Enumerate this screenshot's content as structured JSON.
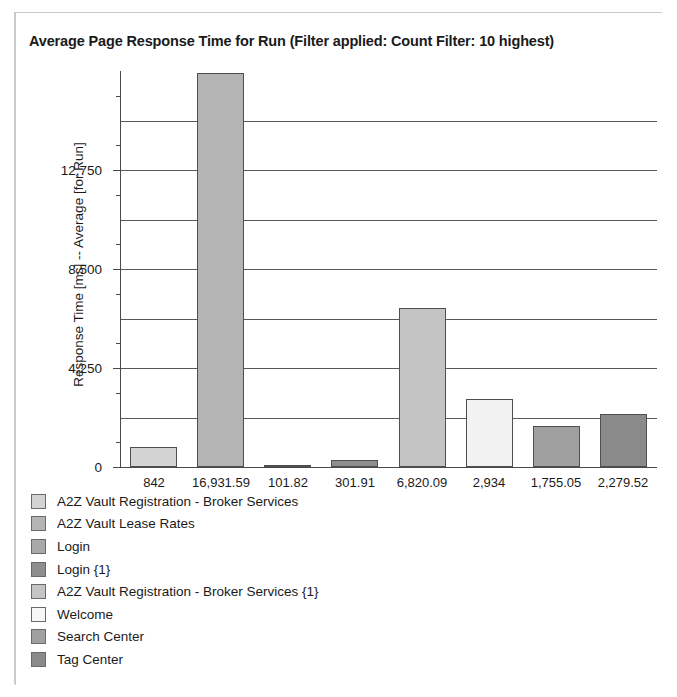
{
  "chart_title": "Average Page Response Time for Run (Filter applied: Count Filter: 10 highest)",
  "chart_data": {
    "type": "bar",
    "title": "Average Page Response Time for Run (Filter applied: Count Filter: 10 highest)",
    "xlabel": "",
    "ylabel": "Response Time [ms] -- Average [for Run]",
    "ylim": [
      0,
      17000
    ],
    "grid": true,
    "legend_position": "bottom-left",
    "y_ticks_major": [
      "0",
      "4,250",
      "8,500",
      "12,750"
    ],
    "y_ticks_major_values": [
      0,
      4250,
      8500,
      12750
    ],
    "y_gridline_values": [
      2125,
      4250,
      6375,
      8500,
      10625,
      12750,
      14875
    ],
    "y_minor_tick_values": [
      1062.5,
      3187.5,
      5312.5,
      7437.5,
      9562.5,
      11687.5,
      13812.5,
      15937.5
    ],
    "categories": [
      "A2Z Vault Registration - Broker Services",
      "A2Z Vault Lease Rates",
      "Login",
      "Login {1}",
      "A2Z Vault Registration - Broker Services {1}",
      "Welcome",
      "Search Center",
      "Tag Center"
    ],
    "tick_labels": [
      "842",
      "16,931.59",
      "101.82",
      "301.91",
      "6,820.09",
      "2,934",
      "1,755.05",
      "2,279.52"
    ],
    "values": [
      842,
      16931.59,
      101.82,
      301.91,
      6820.09,
      2934,
      1755.05,
      2279.52
    ],
    "colors": [
      "#d3d3d3",
      "#b4b4b4",
      "#a9a9a9",
      "#8e8e8e",
      "#c4c4c4",
      "#f2f2f2",
      "#a0a0a0",
      "#8a8a8a"
    ]
  },
  "legend": {
    "items": [
      {
        "label": "A2Z Vault Registration - Broker Services",
        "color": "#d3d3d3"
      },
      {
        "label": "A2Z Vault Lease Rates",
        "color": "#b4b4b4"
      },
      {
        "label": "Login",
        "color": "#a9a9a9"
      },
      {
        "label": "Login {1}",
        "color": "#8e8e8e"
      },
      {
        "label": "A2Z Vault Registration - Broker Services {1}",
        "color": "#c4c4c4"
      },
      {
        "label": "Welcome",
        "color": "#f7f7f7"
      },
      {
        "label": "Search Center",
        "color": "#a0a0a0"
      },
      {
        "label": "Tag Center",
        "color": "#8a8a8a"
      }
    ]
  }
}
